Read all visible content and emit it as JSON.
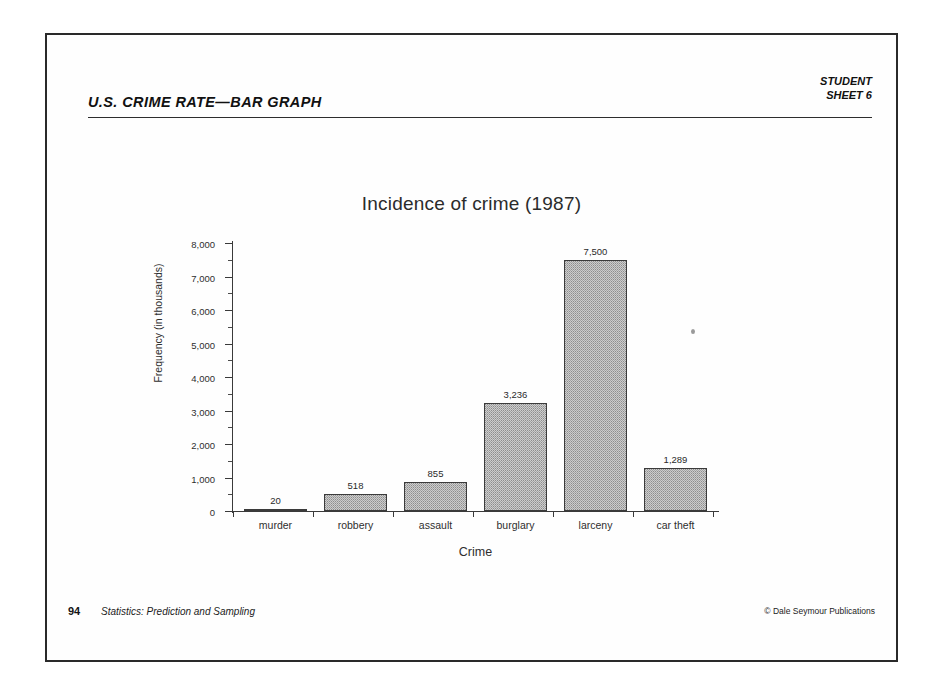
{
  "worksheet": {
    "title": "U.S. CRIME RATE—BAR GRAPH",
    "meta_line1": "STUDENT",
    "meta_line2": "SHEET 6"
  },
  "footer": {
    "page_number": "94",
    "book_title": "Statistics:  Prediction and Sampling",
    "copyright": "© Dale Seymour Publications"
  },
  "chart_data": {
    "type": "bar",
    "title": "Incidence of crime (1987)",
    "xlabel": "Crime",
    "ylabel": "Frequency (in thousands)",
    "categories": [
      "murder",
      "robbery",
      "assault",
      "burglary",
      "larceny",
      "car theft"
    ],
    "values": [
      20,
      518,
      855,
      3236,
      7500,
      1289
    ],
    "value_labels": [
      "20",
      "518",
      "855",
      "3,236",
      "7,500",
      "1,289"
    ],
    "ylim": [
      0,
      8000
    ],
    "ytick_values": [
      0,
      1000,
      2000,
      3000,
      4000,
      5000,
      6000,
      7000,
      8000
    ],
    "ytick_labels": [
      "0",
      "1,000",
      "2,000",
      "3,000",
      "4,000",
      "5,000",
      "6,000",
      "7,000",
      "8,000"
    ],
    "yminor_values": [
      500,
      1500,
      2500,
      3500,
      4500,
      5500,
      6500,
      7500
    ],
    "grid": false,
    "legend": false,
    "bar_fill_color": "#cdcdcd",
    "bar_border_color": "#3b3b3b",
    "axis_color": "#3a3a3a"
  }
}
